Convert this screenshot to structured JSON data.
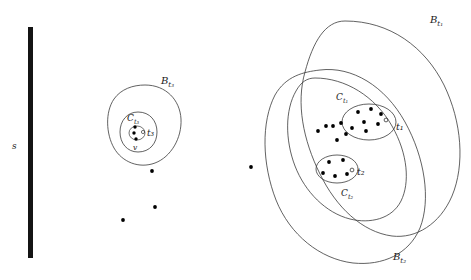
{
  "figure": {
    "type": "set-diagram",
    "background_color": "#ffffff",
    "stroke_color": "#333333",
    "dot_color": "#000000",
    "bar": {
      "name": "s",
      "label": "s",
      "color": "#141414",
      "x": 30,
      "y_top": 27,
      "y_bottom": 258,
      "width": 5,
      "label_x": 12,
      "label_y": 146
    },
    "labels": {
      "B_t3": "B",
      "B_t3_sub": "t₃",
      "C_t3": "C",
      "C_t3_sub": "t₃",
      "t3": "t₃",
      "v": "v",
      "B_t1": "B",
      "B_t1_sub": "t₁",
      "C_t1": "C",
      "C_t1_sub": "t₁",
      "t1": "t₁",
      "B_t2": "B",
      "B_t2_sub": "t₂",
      "C_t2": "C",
      "C_t2_sub": "t₂",
      "t2": "t₂"
    },
    "label_positions": {
      "B_t3": {
        "x": 161,
        "y": 84
      },
      "C_t3": {
        "x": 130,
        "y": 118
      },
      "t3": {
        "x": 149,
        "y": 133
      },
      "v": {
        "x": 136,
        "y": 148
      },
      "B_t1": {
        "x": 432,
        "y": 22
      },
      "C_t1": {
        "x": 340,
        "y": 98
      },
      "t1": {
        "x": 398,
        "y": 127
      },
      "C_t2": {
        "x": 345,
        "y": 194
      },
      "t2": {
        "x": 359,
        "y": 172
      },
      "B_t2": {
        "x": 395,
        "y": 258
      }
    },
    "blobs": [
      {
        "name": "B_t3_blob",
        "label": "B_t3"
      },
      {
        "name": "C_t3_blob",
        "label": "C_t3"
      },
      {
        "name": "B_t1_blob",
        "label": "B_t1"
      },
      {
        "name": "B_t2_blob",
        "label": "B_t2"
      },
      {
        "name": "C_t1_blob",
        "label": "C_t1"
      },
      {
        "name": "t1_ellipse",
        "label": "t1"
      },
      {
        "name": "t2_ellipse",
        "label": "t2"
      }
    ],
    "points": {
      "cluster_t3": [
        {
          "x": 135,
          "y": 126,
          "type": "filled"
        },
        {
          "x": 134,
          "y": 133,
          "type": "filled"
        },
        {
          "x": 135,
          "y": 140,
          "type": "filled"
        },
        {
          "x": 143,
          "y": 133,
          "type": "open"
        }
      ],
      "cluster_t1": [
        {
          "x": 358,
          "y": 113,
          "type": "filled"
        },
        {
          "x": 370,
          "y": 110,
          "type": "filled"
        },
        {
          "x": 380,
          "y": 114,
          "type": "filled"
        },
        {
          "x": 363,
          "y": 122,
          "type": "filled"
        },
        {
          "x": 377,
          "y": 124,
          "type": "filled"
        },
        {
          "x": 352,
          "y": 128,
          "type": "filled"
        },
        {
          "x": 366,
          "y": 131,
          "type": "filled"
        },
        {
          "x": 386,
          "y": 121,
          "type": "open"
        }
      ],
      "cluster_t1_outside": [
        {
          "x": 326,
          "y": 126,
          "type": "filled"
        },
        {
          "x": 333,
          "y": 126,
          "type": "filled"
        },
        {
          "x": 341,
          "y": 123,
          "type": "filled"
        },
        {
          "x": 346,
          "y": 133,
          "type": "filled"
        },
        {
          "x": 337,
          "y": 139,
          "type": "filled"
        },
        {
          "x": 318,
          "y": 131,
          "type": "filled"
        }
      ],
      "cluster_t2": [
        {
          "x": 329,
          "y": 162,
          "type": "filled"
        },
        {
          "x": 343,
          "y": 160,
          "type": "filled"
        },
        {
          "x": 323,
          "y": 173,
          "type": "filled"
        },
        {
          "x": 335,
          "y": 176,
          "type": "filled"
        },
        {
          "x": 346,
          "y": 173,
          "type": "filled"
        },
        {
          "x": 351,
          "y": 171,
          "type": "open"
        }
      ],
      "isolated": [
        {
          "x": 152,
          "y": 171,
          "type": "filled"
        },
        {
          "x": 251,
          "y": 167,
          "type": "filled"
        },
        {
          "x": 155,
          "y": 207,
          "type": "filled"
        },
        {
          "x": 123,
          "y": 220,
          "type": "filled"
        }
      ]
    }
  }
}
